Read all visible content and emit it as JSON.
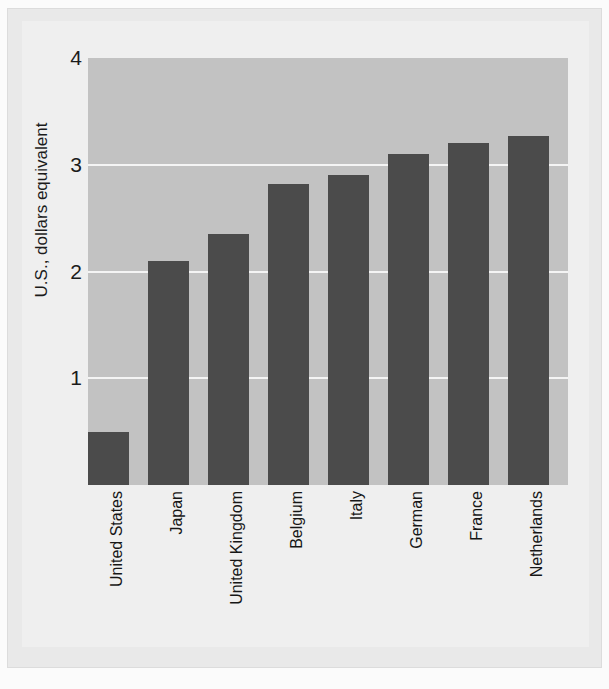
{
  "figure": {
    "background_color": "#efefef",
    "plot_background_color": "#c2c2c2",
    "gridline_color": "#f4f4f4",
    "bar_color": "#4b4b4b",
    "text_color": "#161616"
  },
  "chart_data": {
    "type": "bar",
    "title": "",
    "subtitle": "",
    "xlabel": "",
    "ylabel": "U.S., dollars equivalent",
    "categories": [
      "United States",
      "Japan",
      "United Kingdom",
      "Belgium",
      "Italy",
      "German",
      "France",
      "Netherlands"
    ],
    "values": [
      0.5,
      2.1,
      2.35,
      2.82,
      2.9,
      3.1,
      3.2,
      3.27
    ],
    "ylim": [
      0,
      4
    ],
    "yticks": [
      1,
      2,
      3,
      4
    ],
    "ytick_labels": [
      "1",
      "2",
      "3",
      "4"
    ],
    "grid": true,
    "grid_axis": "y",
    "legend": false,
    "legend_position": "none",
    "orientation": "vertical",
    "xtick_label_rotation": 90,
    "ylabel_rotation": 90
  }
}
